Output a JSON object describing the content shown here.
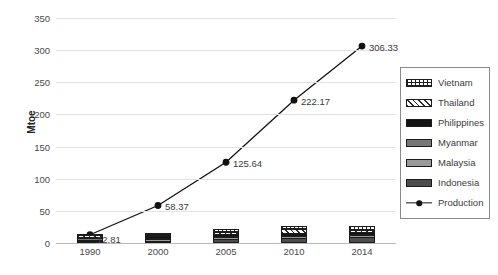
{
  "chart_data": {
    "type": "bar",
    "title": "",
    "subtitle": "",
    "xlabel": "",
    "ylabel": "Mtoe",
    "categories": [
      "1990",
      "2000",
      "2005",
      "2010",
      "2014"
    ],
    "ylim": [
      0,
      350
    ],
    "yticks": [
      "0",
      "50",
      "100",
      "150",
      "200",
      "250",
      "300",
      "350"
    ],
    "grid": true,
    "legend_position": "right",
    "stacked": true,
    "series": [
      {
        "name": "Indonesia",
        "type": "bar",
        "pattern": "solid-dark-gray",
        "color": "#4d4d4d",
        "values": [
          1.2,
          3.6,
          7.0,
          8.4,
          9.2
        ]
      },
      {
        "name": "Malaysia",
        "type": "bar",
        "pattern": "solid-light-gray",
        "color": "#9a9a9a",
        "values": [
          0.5,
          1.3,
          2.0,
          2.3,
          2.6
        ]
      },
      {
        "name": "Myanmar",
        "type": "bar",
        "pattern": "solid-mid-gray",
        "color": "#777777",
        "values": [
          0.3,
          0.8,
          1.2,
          1.4,
          1.6
        ]
      },
      {
        "name": "Philippines",
        "type": "bar",
        "pattern": "solid-black",
        "color": "#141414",
        "values": [
          0.4,
          1.0,
          1.6,
          1.9,
          2.1
        ]
      },
      {
        "name": "Thailand",
        "type": "bar",
        "pattern": "diagonal-hatch",
        "color": "#ffffff",
        "values": [
          0.6,
          1.8,
          3.2,
          6.5,
          4.0
        ]
      },
      {
        "name": "Vietnam",
        "type": "bar",
        "pattern": "cross-hatch",
        "color": "#ffffff",
        "values": [
          0.5,
          2.0,
          4.0,
          5.0,
          6.5
        ]
      },
      {
        "name": "Production",
        "type": "line",
        "pattern": "line-marker",
        "color": "#111111",
        "values": [
          12.81,
          58.37,
          125.64,
          222.17,
          306.33
        ],
        "data_labels": [
          "12.81",
          "58.37",
          "125.64",
          "222.17",
          "306.33"
        ]
      }
    ]
  },
  "legend": {
    "items": [
      {
        "label": "Vietnam"
      },
      {
        "label": "Thailand"
      },
      {
        "label": "Philippines"
      },
      {
        "label": "Myanmar"
      },
      {
        "label": "Malaysia"
      },
      {
        "label": "Indonesia"
      },
      {
        "label": "Production"
      }
    ]
  },
  "colors": {
    "gridline": "#e2e2e2",
    "baseline": "#b9b9b9",
    "line": "#111111",
    "text": "#3a3a3a",
    "legend_border": "#8a8a8a"
  }
}
